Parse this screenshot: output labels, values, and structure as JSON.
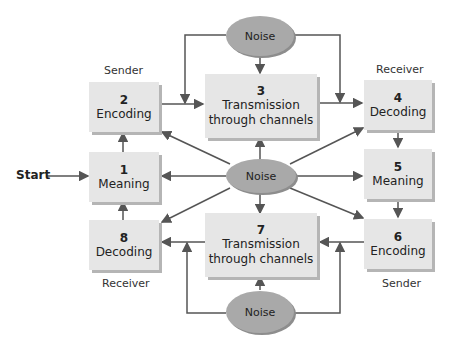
{
  "diagram": {
    "start_label": "Start",
    "roles": {
      "sender_top": "Sender",
      "receiver_top": "Receiver",
      "receiver_bottom": "Receiver",
      "sender_bottom": "Sender"
    },
    "steps": [
      {
        "num": "1",
        "label": "Meaning"
      },
      {
        "num": "2",
        "label": "Encoding"
      },
      {
        "num": "3",
        "label": "Transmission through channels"
      },
      {
        "num": "4",
        "label": "Decoding"
      },
      {
        "num": "5",
        "label": "Meaning"
      },
      {
        "num": "6",
        "label": "Encoding"
      },
      {
        "num": "7",
        "label": "Transmission through channels"
      },
      {
        "num": "8",
        "label": "Decoding"
      }
    ],
    "noise": {
      "top": "Noise",
      "center": "Noise",
      "bottom": "Noise"
    },
    "colors": {
      "box_fill": "#e6e6e6",
      "noise_fill": "#a9a9a9",
      "arrow": "#555555"
    }
  }
}
